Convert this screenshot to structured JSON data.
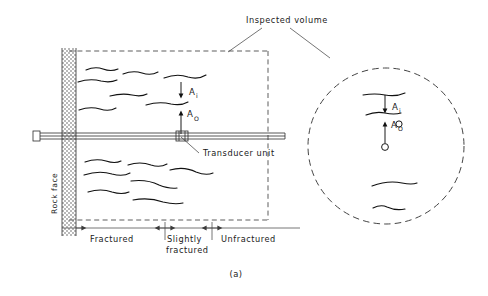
{
  "figure": {
    "caption": "(a)",
    "domain": "engineering-diagram"
  },
  "labels": {
    "inspected_volume": "Inspected  volume",
    "transducer_unit": "Transducer   unit",
    "rock_face": "Rock  face",
    "amplitude_incident": "A",
    "amplitude_incident_sub": "i",
    "amplitude_output": "A",
    "amplitude_output_sub": "O"
  },
  "zones": [
    {
      "id": "fractured",
      "label": "Fractured"
    },
    {
      "id": "slightly-fractured",
      "label": "Slightly",
      "label2": "fractured"
    },
    {
      "id": "unfractured",
      "label": "Unfractured"
    }
  ],
  "colors": {
    "ink": "#1a1a1a",
    "line": "#2b2b2b",
    "dash": "#555555",
    "hatch": "#9a9a9a",
    "background": "#ffffff"
  },
  "geometry": {
    "rock_face_x": 62,
    "rock_face_width": 14,
    "inspected_box": {
      "x": 69,
      "y": 50,
      "w": 199,
      "h": 170
    },
    "detail_circle": {
      "cx": 386,
      "cy": 146,
      "r": 78
    },
    "borehole_y": 137
  }
}
